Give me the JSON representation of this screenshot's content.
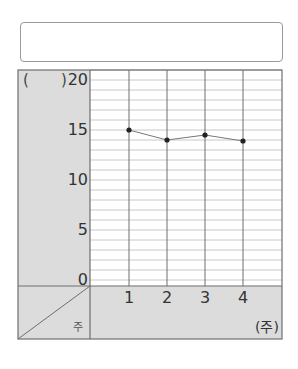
{
  "title_box": {
    "text": ""
  },
  "chart_data": {
    "type": "line",
    "title": "",
    "unit_label_left": "(",
    "unit_label_right": ")",
    "xlabel": "주",
    "x_unit": "(주)",
    "ylabel": "",
    "categories": [
      "1",
      "2",
      "3",
      "4"
    ],
    "series": [
      {
        "name": "",
        "values": [
          15,
          14,
          14.5,
          13.9
        ]
      }
    ],
    "ylim": [
      0,
      20
    ],
    "y_ticks": [
      "20",
      "15",
      "10",
      "5",
      "0"
    ],
    "grid": true,
    "minor_grid_step": 1
  },
  "colors": {
    "panel": "#dcdcdc",
    "grid_major": "#6e6e6e",
    "grid_minor": "#c8c8c8",
    "line": "#777777",
    "point": "#222222"
  }
}
